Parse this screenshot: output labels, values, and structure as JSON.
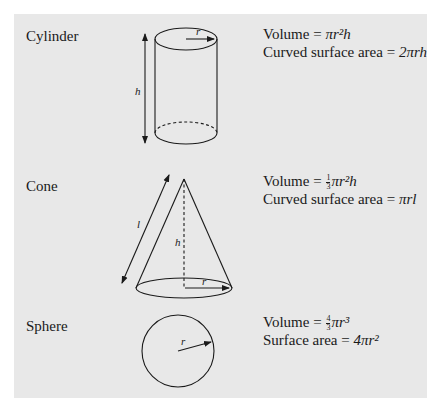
{
  "colors": {
    "panel": "#e8e8e8",
    "ink": "#1a1a1a",
    "page": "#ffffff"
  },
  "shapes": [
    {
      "name": "Cylinder",
      "labels": {
        "radius": "r",
        "height": "h"
      },
      "formulas": [
        {
          "label": "Volume",
          "expr": "πr²h"
        },
        {
          "label": "Curved surface area",
          "expr": "2πrh"
        }
      ]
    },
    {
      "name": "Cone",
      "labels": {
        "radius": "r",
        "height": "h",
        "slant": "l"
      },
      "formulas": [
        {
          "label": "Volume",
          "coef_num": "1",
          "coef_den": "3",
          "expr": "πr²h"
        },
        {
          "label": "Curved surface area",
          "expr": "πrl"
        }
      ]
    },
    {
      "name": "Sphere",
      "labels": {
        "radius": "r"
      },
      "formulas": [
        {
          "label": "Volume",
          "coef_num": "4",
          "coef_den": "3",
          "expr": "πr³"
        },
        {
          "label": "Surface area",
          "expr": "4πr²"
        }
      ]
    }
  ],
  "eq": "="
}
